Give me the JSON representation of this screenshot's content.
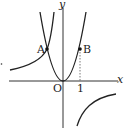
{
  "diagram": {
    "type": "function-graph",
    "axes": {
      "x_label": "x",
      "y_label": "y",
      "origin_label": "O",
      "x_tick_label": "1"
    },
    "curves": [
      {
        "name": "parabola",
        "equation": "y = a x^2",
        "color": "#222222"
      },
      {
        "name": "hyperbola",
        "equation": "y = b / x (b < 0)",
        "color": "#222222"
      }
    ],
    "points": [
      {
        "label": "A",
        "description": "intersection of parabola and hyperbola, x = -1"
      },
      {
        "label": "B",
        "description": "point on parabola at x = 1"
      }
    ],
    "guides": [
      {
        "type": "dashed",
        "description": "vertical line from B to x-axis at x = 1"
      }
    ]
  }
}
